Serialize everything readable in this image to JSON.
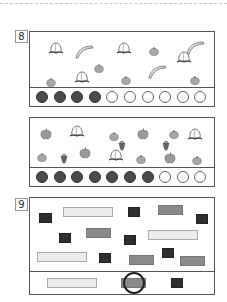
{
  "problems": [
    {
      "number": "8",
      "counter": {
        "total": 10,
        "filled": 4
      },
      "items": [
        {
          "type": "peach",
          "x": 18,
          "y": 9
        },
        {
          "type": "banana",
          "x": 44,
          "y": 11
        },
        {
          "type": "peach",
          "x": 86,
          "y": 9
        },
        {
          "type": "tangerine",
          "x": 119,
          "y": 9
        },
        {
          "type": "banana",
          "x": 155,
          "y": 7
        },
        {
          "type": "tangerine",
          "x": 64,
          "y": 26
        },
        {
          "type": "peach",
          "x": 146,
          "y": 18
        },
        {
          "type": "tangerine",
          "x": 16,
          "y": 40
        },
        {
          "type": "peach",
          "x": 44,
          "y": 38
        },
        {
          "type": "tangerine",
          "x": 91,
          "y": 38
        },
        {
          "type": "banana",
          "x": 117,
          "y": 31
        },
        {
          "type": "tangerine",
          "x": 160,
          "y": 38
        }
      ]
    },
    {
      "number": "",
      "counter": {
        "total": 10,
        "filled": 7
      },
      "items": [
        {
          "type": "apple",
          "x": 10,
          "y": 7
        },
        {
          "type": "peach",
          "x": 39,
          "y": 6
        },
        {
          "type": "tangerine",
          "x": 79,
          "y": 8
        },
        {
          "type": "apple",
          "x": 107,
          "y": 7
        },
        {
          "type": "tangerine",
          "x": 139,
          "y": 6
        },
        {
          "type": "peach",
          "x": 157,
          "y": 9
        },
        {
          "type": "strawberry",
          "x": 88,
          "y": 18
        },
        {
          "type": "strawberry",
          "x": 132,
          "y": 18
        },
        {
          "type": "tangerine",
          "x": 7,
          "y": 29
        },
        {
          "type": "strawberry",
          "x": 30,
          "y": 31
        },
        {
          "type": "apple",
          "x": 49,
          "y": 26
        },
        {
          "type": "peach",
          "x": 78,
          "y": 30
        },
        {
          "type": "tangerine",
          "x": 106,
          "y": 31
        },
        {
          "type": "apple",
          "x": 134,
          "y": 31
        },
        {
          "type": "tangerine",
          "x": 162,
          "y": 32
        }
      ]
    },
    {
      "number": "9",
      "shapes": [
        {
          "kind": "light",
          "x": 33,
          "y": 9,
          "w": 50,
          "h": 10
        },
        {
          "kind": "dark",
          "x": 9,
          "y": 15,
          "w": 13,
          "h": 10
        },
        {
          "kind": "dark",
          "x": 98,
          "y": 9,
          "w": 12,
          "h": 10
        },
        {
          "kind": "mid",
          "x": 128,
          "y": 7,
          "w": 25,
          "h": 10
        },
        {
          "kind": "dark",
          "x": 166,
          "y": 16,
          "w": 12,
          "h": 10
        },
        {
          "kind": "dark",
          "x": 29,
          "y": 35,
          "w": 12,
          "h": 10
        },
        {
          "kind": "mid",
          "x": 56,
          "y": 30,
          "w": 25,
          "h": 10
        },
        {
          "kind": "dark",
          "x": 94,
          "y": 37,
          "w": 12,
          "h": 10
        },
        {
          "kind": "light",
          "x": 118,
          "y": 32,
          "w": 50,
          "h": 10
        },
        {
          "kind": "light",
          "x": 7,
          "y": 54,
          "w": 50,
          "h": 10
        },
        {
          "kind": "dark",
          "x": 69,
          "y": 55,
          "w": 12,
          "h": 10
        },
        {
          "kind": "mid",
          "x": 99,
          "y": 57,
          "w": 25,
          "h": 10
        },
        {
          "kind": "dark",
          "x": 132,
          "y": 50,
          "w": 12,
          "h": 10
        },
        {
          "kind": "mid",
          "x": 150,
          "y": 58,
          "w": 25,
          "h": 10
        }
      ],
      "answers": [
        {
          "kind": "light",
          "x": 17,
          "y": 6,
          "w": 50,
          "h": 10
        },
        {
          "kind": "mid",
          "x": 91,
          "y": 6,
          "w": 25,
          "h": 10
        },
        {
          "kind": "dark",
          "x": 141,
          "y": 6,
          "w": 12,
          "h": 10
        }
      ],
      "circled_answer_index": 1
    }
  ]
}
